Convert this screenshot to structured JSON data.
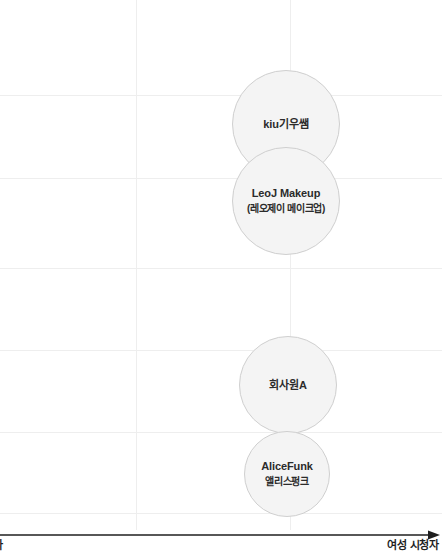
{
  "chart_data": {
    "type": "scatter",
    "title": "",
    "xlabel": "여성 시청자",
    "ylabel": "",
    "grid": true,
    "legend": "none",
    "axis": {
      "x_axis_right_label": "여성 시청자",
      "x_axis_left_label_clipped": "자",
      "arrow_direction": "right"
    },
    "gridlines": {
      "horizontal_y": [
        95,
        178,
        268,
        350,
        432,
        513
      ],
      "vertical_x": [
        136,
        290
      ]
    },
    "bubbles": [
      {
        "name": "kiu기우쌤",
        "label_main": "kiu기우쌤",
        "label_sub": "",
        "cx": 286,
        "cy": 124,
        "r": 54
      },
      {
        "name": "LeoJ Makeup",
        "label_main": "LeoJ Makeup",
        "label_sub": "(레오제이 메이크업)",
        "cx": 286,
        "cy": 201,
        "r": 54
      },
      {
        "name": "회사원A",
        "label_main": "회사원A",
        "label_sub": "",
        "cx": 288,
        "cy": 385,
        "r": 49
      },
      {
        "name": "AliceFunk",
        "label_main": "AliceFunk",
        "label_sub": "앨리스펑크",
        "cx": 287,
        "cy": 474,
        "r": 43
      }
    ]
  },
  "colors": {
    "bubble_fill": "#f4f4f4",
    "bubble_stroke": "#cfcfcf",
    "gridline": "#eeeeee",
    "axis": "#1f1f1f",
    "text": "#2b2b2b",
    "background": "#ffffff"
  }
}
